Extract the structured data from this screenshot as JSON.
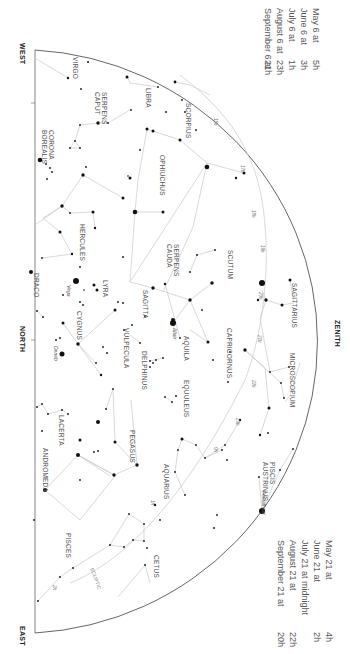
{
  "directions": {
    "west": "WEST",
    "north": "NORTH",
    "east": "EAST",
    "zenith": "ZENITH"
  },
  "legend_top": {
    "rows": [
      {
        "date": "May 6 at",
        "time": "5h"
      },
      {
        "date": "June 6 at",
        "time": "3h"
      },
      {
        "date": "July 6 at",
        "time": "1h"
      },
      {
        "date": "August 6 at",
        "time": "23h"
      },
      {
        "date": "September 6 at",
        "time": "21h"
      }
    ]
  },
  "legend_bottom": {
    "rows": [
      {
        "date": "May 21 at",
        "time": "4h"
      },
      {
        "date": "June 21 at",
        "time": "2h"
      },
      {
        "date": "July 21 at midnight",
        "time": ""
      },
      {
        "date": "August 21 at",
        "time": "22h"
      },
      {
        "date": "September 21 at",
        "time": "20h"
      }
    ]
  },
  "constellations": {
    "virgo": "VIRGO",
    "libra": "LIBRA",
    "serpens_caput": "SERPENS CAPUT",
    "scorpius": "SCORPIUS",
    "corona_borealis": "CORONA BOREALIS",
    "ophiuchus": "OPHIUCHUS",
    "hercules": "HERCULES",
    "serpens_cauda": "SERPENS CAUDA",
    "scutum": "SCUTUM",
    "sagittarius": "SAGITTARIUS",
    "draco": "DRACO",
    "lyra": "LYRA",
    "sagitta": "SAGITTA",
    "aquila": "AQUILA",
    "capricornus": "CAPRICORNUS",
    "microscopium": "MICROSCOPIUM",
    "cygnus": "CYGNUS",
    "vulpecula": "VULPECULA",
    "delphinus": "DELPHINUS",
    "equuleus": "EQUULEUS",
    "lacerta": "LACERTA",
    "pegasus": "PEGASUS",
    "aquarius": "AQUARIUS",
    "piscis_austrinus": "PISCIS AUSTRINUS",
    "andromeda": "ANDROMEDA",
    "pisces": "PISCES",
    "cetus": "CETUS"
  },
  "stars": {
    "vega": "Vega",
    "altair": "Altair",
    "deneb": "Deneb",
    "fomalhaut": "Fomalhaut"
  },
  "ecliptic": {
    "label": "ECLIPTIC",
    "degrees": [
      "15h",
      "17h",
      "18h",
      "19h",
      "20h",
      "21h",
      "22h",
      "23h",
      "0h",
      "1h",
      "2h"
    ]
  },
  "colors": {
    "line": "#c8c8c8",
    "horizon": "#555555",
    "star": "#111111",
    "text": "#555555"
  }
}
